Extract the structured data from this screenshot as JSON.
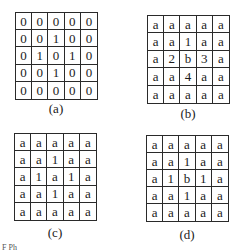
{
  "figure": {
    "panels": [
      {
        "id": "a",
        "label": "(a)",
        "rows": [
          [
            "0",
            "0",
            "0",
            "0",
            "0"
          ],
          [
            "0",
            "0",
            "1",
            "0",
            "0"
          ],
          [
            "0",
            "1",
            "0",
            "1",
            "0"
          ],
          [
            "0",
            "0",
            "1",
            "0",
            "0"
          ],
          [
            "0",
            "0",
            "0",
            "0",
            "0"
          ]
        ]
      },
      {
        "id": "b",
        "label": "(b)",
        "rows": [
          [
            "a",
            "a",
            "a",
            "a",
            "a"
          ],
          [
            "a",
            "a",
            "1",
            "a",
            "a"
          ],
          [
            "a",
            "2",
            "b",
            "3",
            "a"
          ],
          [
            "a",
            "a",
            "4",
            "a",
            "a"
          ],
          [
            "a",
            "a",
            "a",
            "a",
            "a"
          ]
        ]
      },
      {
        "id": "c",
        "label": "(c)",
        "rows": [
          [
            "a",
            "a",
            "a",
            "a",
            "a"
          ],
          [
            "a",
            "a",
            "1",
            "a",
            "a"
          ],
          [
            "a",
            "1",
            "a",
            "1",
            "a"
          ],
          [
            "a",
            "a",
            "1",
            "a",
            "a"
          ],
          [
            "a",
            "a",
            "a",
            "a",
            "a"
          ]
        ]
      },
      {
        "id": "d",
        "label": "(d)",
        "rows": [
          [
            "a",
            "a",
            "a",
            "a",
            "a"
          ],
          [
            "a",
            "a",
            "1",
            "a",
            "a"
          ],
          [
            "a",
            "1",
            "b",
            "1",
            "a"
          ],
          [
            "a",
            "a",
            "1",
            "a",
            "a"
          ],
          [
            "a",
            "a",
            "a",
            "a",
            "a"
          ]
        ]
      }
    ],
    "caption_fragment": "F  Ph"
  }
}
